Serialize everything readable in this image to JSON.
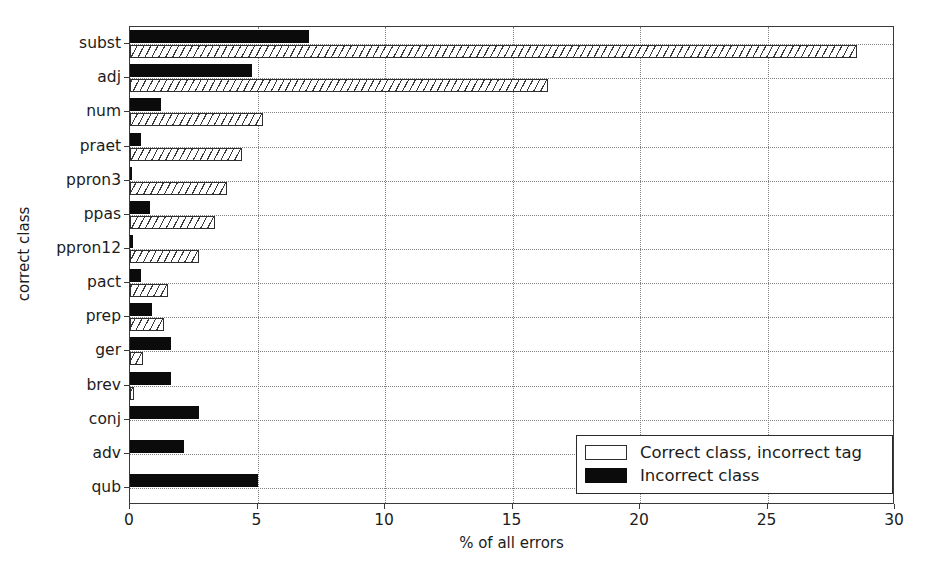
{
  "chart_data": {
    "type": "bar",
    "orientation": "horizontal",
    "title": "",
    "xlabel": "% of all errors",
    "ylabel": "correct class",
    "xlim": [
      0,
      30
    ],
    "xticks": [
      0,
      5,
      10,
      15,
      20,
      25,
      30
    ],
    "xticklabels": [
      "0",
      "5",
      "10",
      "15",
      "20",
      "25",
      "30"
    ],
    "grid": true,
    "grid_style": "dotted",
    "legend_position": "lower right",
    "categories": [
      "subst",
      "adj",
      "num",
      "praet",
      "ppron3",
      "ppas",
      "ppron12",
      "pact",
      "prep",
      "ger",
      "brev",
      "conj",
      "adv",
      "qub"
    ],
    "series": [
      {
        "name": "Correct class, incorrect tag",
        "style": "hatched",
        "color": "#ffffff",
        "edgecolor": "#2e2e2e",
        "values": [
          28.5,
          16.4,
          5.2,
          4.4,
          3.8,
          3.35,
          2.7,
          1.5,
          1.35,
          0.5,
          0.15,
          0.0,
          0.0,
          0.0
        ]
      },
      {
        "name": "Incorrect class",
        "style": "filled",
        "color": "#0b0b0b",
        "edgecolor": "#0b0b0b",
        "values": [
          7.0,
          4.8,
          1.2,
          0.45,
          0.05,
          0.8,
          0.1,
          0.45,
          0.85,
          1.6,
          1.6,
          2.7,
          2.1,
          5.0
        ]
      }
    ]
  },
  "legend": {
    "entries": [
      {
        "label": "Correct class, incorrect tag",
        "swatch": "hatched"
      },
      {
        "label": "Incorrect class",
        "swatch": "filled"
      }
    ]
  }
}
